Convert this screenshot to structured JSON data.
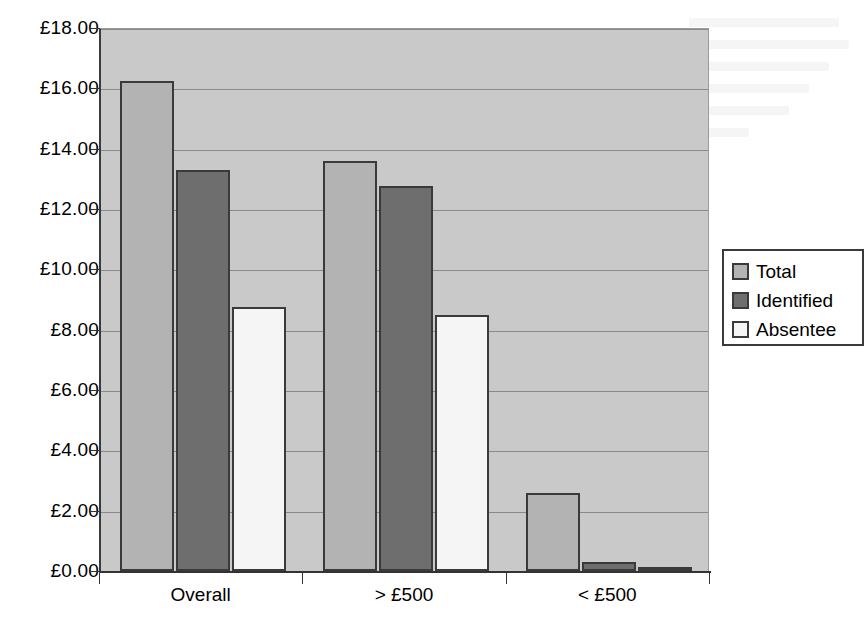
{
  "chart_data": {
    "type": "bar",
    "title": "",
    "xlabel": "",
    "ylabel": "",
    "categories": [
      "Overall",
      "> £500",
      "< £500"
    ],
    "series": [
      {
        "name": "Total",
        "color": "#b3b3b3",
        "values": [
          16.25,
          13.6,
          2.6
        ]
      },
      {
        "name": "Identified",
        "color": "#6e6e6e",
        "values": [
          13.3,
          12.75,
          0.3
        ]
      },
      {
        "name": "Absentee",
        "color": "#f5f5f5",
        "values": [
          8.75,
          8.5,
          0.1
        ]
      }
    ],
    "ylim": [
      0,
      18
    ],
    "ytick_step": 2,
    "ytick_labels": [
      "£0.00",
      "£2.00",
      "£4.00",
      "£6.00",
      "£8.00",
      "£10.00",
      "£12.00",
      "£14.00",
      "£16.00",
      "£18.00"
    ],
    "ytick_values": [
      0,
      2,
      4,
      6,
      8,
      10,
      12,
      14,
      16,
      18
    ],
    "grid": true,
    "legend_position": "right",
    "currency_prefix": "£",
    "plot_background": "#c9c9c9",
    "axis_color": "#333333",
    "gridline_color": "#8a8a8a"
  },
  "legend": {
    "entries": [
      {
        "label": "Total"
      },
      {
        "label": "Identified"
      },
      {
        "label": "Absentee"
      }
    ]
  }
}
